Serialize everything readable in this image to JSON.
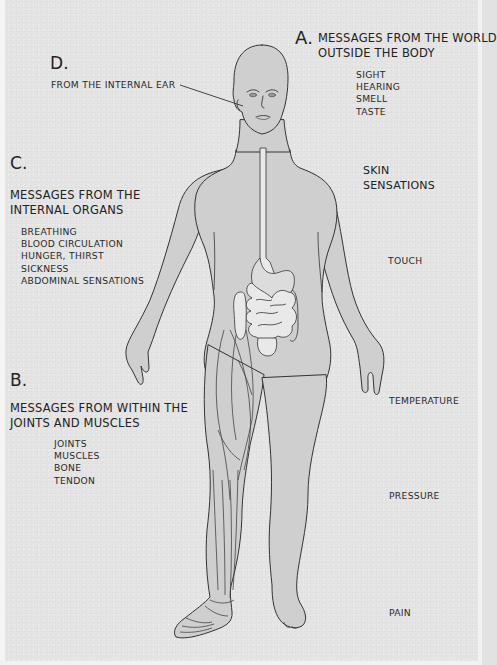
{
  "diagram": {
    "colors": {
      "background": "#e4e4e4",
      "body_fill": "#cfcfcf",
      "organ_fill": "#e9e9e9",
      "outline": "#333333",
      "text": "#222222"
    }
  },
  "section_a": {
    "letter": "A.",
    "heading_line1": "MESSAGES FROM THE WORLD",
    "heading_line2": "OUTSIDE THE BODY",
    "items": [
      "SIGHT",
      "HEARING",
      "SMELL",
      "TASTE"
    ]
  },
  "section_b": {
    "letter": "B.",
    "heading_line1": "MESSAGES FROM WITHIN THE",
    "heading_line2": "JOINTS AND MUSCLES",
    "items": [
      "JOINTS",
      "MUSCLES",
      "BONE",
      "TENDON"
    ]
  },
  "section_c": {
    "letter": "C.",
    "heading_line1": "MESSAGES FROM THE",
    "heading_line2": "INTERNAL ORGANS",
    "items": [
      "BREATHING",
      "BLOOD CIRCULATION",
      "HUNGER, THIRST",
      "SICKNESS",
      "ABDOMINAL SENSATIONS"
    ]
  },
  "section_d": {
    "letter": "D.",
    "label": "FROM THE INTERNAL EAR"
  },
  "skin": {
    "heading_line1": "SKIN",
    "heading_line2": "SENSATIONS",
    "items": [
      "TOUCH",
      "TEMPERATURE",
      "PRESSURE",
      "PAIN"
    ]
  }
}
